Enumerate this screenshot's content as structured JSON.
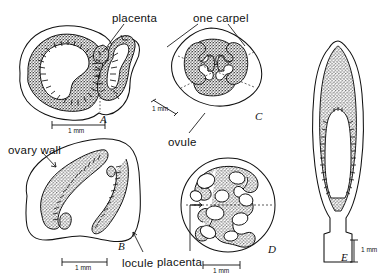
{
  "figure": {
    "kind": "botanical-line-drawing",
    "background_color": "#ffffff",
    "ink_color": "#111111",
    "stipple_color": "#2b2b2b"
  },
  "labels": [
    {
      "id": "placenta-top",
      "text": "placenta",
      "x": 112,
      "y": 12
    },
    {
      "id": "one-carpel",
      "text": "one carpel",
      "x": 193,
      "y": 12
    },
    {
      "id": "ovary-wall",
      "text": "ovary wall",
      "x": 8,
      "y": 144
    },
    {
      "id": "ovule",
      "text": "ovule",
      "x": 168,
      "y": 136
    },
    {
      "id": "locule",
      "text": "locule",
      "x": 122,
      "y": 257
    },
    {
      "id": "placenta-bottom",
      "text": "placenta",
      "x": 157,
      "y": 256
    }
  ],
  "panels": [
    {
      "id": "A",
      "letter": "A",
      "letter_x": 100,
      "letter_y": 113,
      "scale_label": "1 mm"
    },
    {
      "id": "B",
      "letter": "B",
      "letter_x": 118,
      "letter_y": 240,
      "scale_label": "1 mm"
    },
    {
      "id": "C",
      "letter": "C",
      "letter_x": 255,
      "letter_y": 110,
      "scale_label": "1 mm"
    },
    {
      "id": "D",
      "letter": "D",
      "letter_x": 268,
      "letter_y": 243,
      "scale_label": "1 mm"
    },
    {
      "id": "E",
      "letter": "E",
      "letter_x": 341,
      "letter_y": 251,
      "scale_label": "1 mm"
    }
  ],
  "scale_bars": [
    {
      "id": "scale-a",
      "label": "1 mm",
      "text_x": 68,
      "text_y": 131,
      "orientation": "horizontal"
    },
    {
      "id": "scale-b",
      "label": "1 mm",
      "text_x": 78,
      "text_y": 268,
      "orientation": "horizontal"
    },
    {
      "id": "scale-c",
      "label": "1 mm",
      "text_x": 152,
      "text_y": 110,
      "orientation": "diagonal"
    },
    {
      "id": "scale-d",
      "label": "1 mm",
      "text_x": 216,
      "text_y": 271,
      "orientation": "horizontal"
    },
    {
      "id": "scale-e",
      "label": "1 mm",
      "text_x": 362,
      "text_y": 248,
      "orientation": "vertical"
    }
  ]
}
